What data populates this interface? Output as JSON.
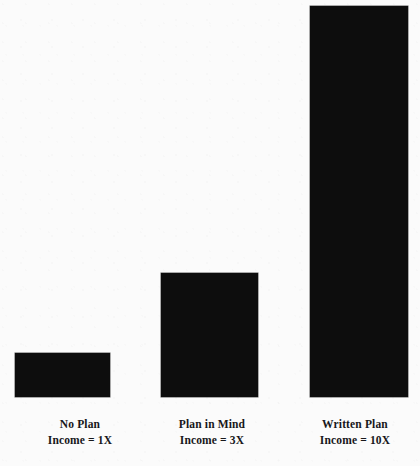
{
  "chart_data": {
    "type": "bar",
    "title": "",
    "subtitle": "",
    "xlabel": "",
    "ylabel": "",
    "grid": false,
    "legend": "none",
    "ylim": [
      0,
      11
    ],
    "categories": [
      "No Plan",
      "Plan in Mind",
      "Written Plan"
    ],
    "values": [
      1,
      3,
      10
    ],
    "value_labels": [
      "Income = 1X",
      "Income = 3X",
      "Income = 10X"
    ],
    "bar_color": "#0d0d0d",
    "background_color": "#fbfbfb",
    "bars": [
      {
        "category": "No Plan",
        "value": 1,
        "value_label": "Income = 1X",
        "label_line1": "No Plan",
        "label_line2": "Income = 1X",
        "left_px": 15,
        "width_px": 95,
        "top_px": 353,
        "height_px": 44
      },
      {
        "category": "Plan in Mind",
        "value": 3,
        "value_label": "Income = 3X",
        "label_line1": "Plan in Mind",
        "label_line2": "Income = 3X",
        "left_px": 161,
        "width_px": 97,
        "top_px": 273,
        "height_px": 124
      },
      {
        "category": "Written Plan",
        "value": 10,
        "value_label": "Income = 10X",
        "label_line1": "Written Plan",
        "label_line2": "Income = 10X",
        "left_px": 310,
        "width_px": 98,
        "top_px": 6,
        "height_px": 391
      }
    ],
    "baseline_px": 397
  }
}
